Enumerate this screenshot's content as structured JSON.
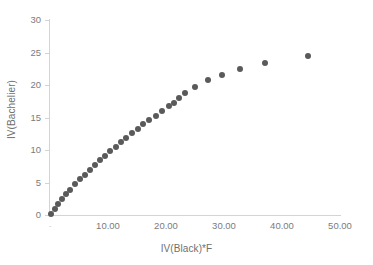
{
  "chart_data": {
    "type": "scatter",
    "title": "",
    "xlabel": "IV(Black)*F",
    "ylabel": "IV(Bachelier)",
    "xlim": [
      0,
      50
    ],
    "ylim": [
      0,
      30
    ],
    "grid": false,
    "legend": null,
    "marker_color": "#5a5a5a",
    "axis_color": "#d4d4d4",
    "tick_label_color": "#7b7b7b",
    "xticks": [
      0,
      10,
      20,
      30,
      40,
      50
    ],
    "xtick_labels": [
      "-",
      "10.00",
      "20.00",
      "30.00",
      "40.00",
      "50.00"
    ],
    "yticks": [
      0,
      5,
      10,
      15,
      20,
      25,
      30
    ],
    "ytick_labels": [
      "0",
      "5",
      "10",
      "15",
      "20",
      "25",
      "30"
    ],
    "series": [
      {
        "name": "IV(Bachelier) vs IV(Black)*F",
        "points": [
          [
            0.25,
            0.2
          ],
          [
            0.8,
            0.9
          ],
          [
            1.4,
            1.7
          ],
          [
            2.1,
            2.4
          ],
          [
            2.8,
            3.2
          ],
          [
            3.5,
            3.9
          ],
          [
            4.3,
            4.7
          ],
          [
            5.1,
            5.5
          ],
          [
            6.0,
            6.2
          ],
          [
            6.9,
            7.0
          ],
          [
            7.8,
            7.7
          ],
          [
            8.7,
            8.4
          ],
          [
            9.5,
            9.1
          ],
          [
            10.4,
            9.8
          ],
          [
            11.3,
            10.5
          ],
          [
            12.2,
            11.2
          ],
          [
            13.1,
            11.8
          ],
          [
            14.1,
            12.6
          ],
          [
            15.1,
            13.3
          ],
          [
            16.1,
            14.0
          ],
          [
            17.1,
            14.6
          ],
          [
            18.2,
            15.3
          ],
          [
            19.3,
            16.0
          ],
          [
            20.5,
            16.8
          ],
          [
            21.4,
            17.2
          ],
          [
            22.3,
            18.0
          ],
          [
            23.3,
            18.8
          ],
          [
            25.0,
            19.7
          ],
          [
            27.2,
            20.7
          ],
          [
            29.7,
            21.6
          ],
          [
            32.8,
            22.5
          ],
          [
            37.0,
            23.4
          ],
          [
            44.4,
            24.4
          ]
        ]
      }
    ]
  }
}
